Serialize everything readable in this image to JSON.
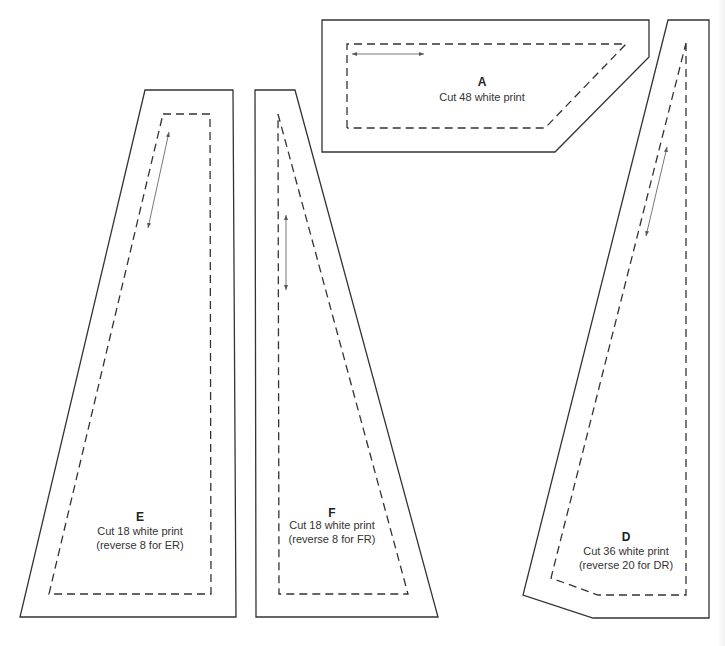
{
  "pieces": {
    "A": {
      "letter": "A",
      "line1": "Cut 48 white print",
      "line2": ""
    },
    "D": {
      "letter": "D",
      "line1": "Cut 36 white print",
      "line2": "(reverse 20 for DR)"
    },
    "E": {
      "letter": "E",
      "line1": "Cut 18 white print",
      "line2": "(reverse 8 for ER)"
    },
    "F": {
      "letter": "F",
      "line1": "Cut 18 white print",
      "line2": "(reverse 8 for FR)"
    }
  },
  "colors": {
    "line": "#333333",
    "background": "#ffffff"
  }
}
